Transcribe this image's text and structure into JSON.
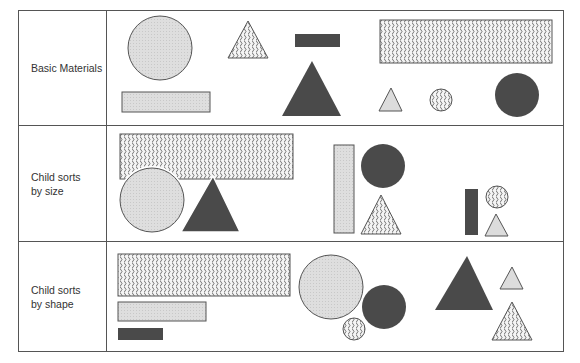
{
  "diagram": {
    "rows": [
      {
        "label": "Basic Materials"
      },
      {
        "label": "Child sorts\nby size"
      },
      {
        "label": "Child sorts\nby shape"
      }
    ],
    "fills": {
      "light": "#dcdcdc",
      "dark": "#4a4a4a",
      "wavy": "wavy-pattern"
    },
    "shapes_per_row": 9,
    "materials": [
      "large light circle",
      "medium wavy triangle",
      "small dark bar",
      "large wavy rectangle",
      "long light rectangle",
      "large dark triangle",
      "small light triangle",
      "small wavy circle",
      "medium dark circle"
    ]
  }
}
